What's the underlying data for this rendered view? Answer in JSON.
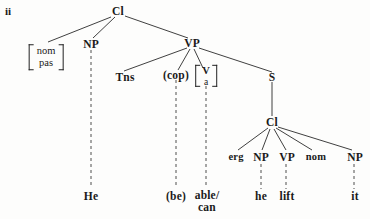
{
  "figure": {
    "enumeration_label": "ii",
    "background_color": "#fdfdfc",
    "ink_color": "#1a1a1a"
  },
  "nodes": {
    "root_cl": "Cl",
    "subject_np": "NP",
    "vp": "VP",
    "tns": "Tns",
    "cop": "(cop)",
    "s": "S",
    "embedded_cl": "Cl",
    "erg": "erg",
    "emb_np_subject": "NP",
    "emb_vp": "VP",
    "nom": "nom",
    "emb_np_object": "NP"
  },
  "feature_matrix": {
    "line1": "nom",
    "line2": "pas"
  },
  "category_matrix": {
    "line1": "V",
    "line2": "a"
  },
  "terminals": {
    "he_upper": "He",
    "be": "(be)",
    "able_line1": "able/",
    "able_line2": "can",
    "he_lower": "he",
    "lift": "lift",
    "it": "it"
  }
}
